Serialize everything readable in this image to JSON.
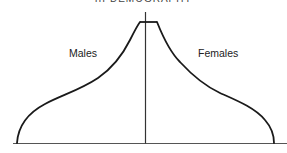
{
  "figure": {
    "title": "III DEMOGRAPHY",
    "labels": {
      "left": "Males",
      "right": "Females"
    },
    "colors": {
      "line": "#1a1a1a",
      "axis": "#333333",
      "background": "#ffffff"
    }
  }
}
